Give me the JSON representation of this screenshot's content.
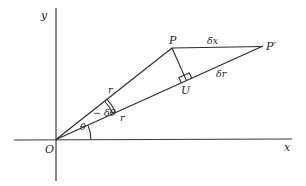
{
  "diagram": {
    "axes": {
      "x_label": "x",
      "y_label": "y",
      "origin_label": "O"
    },
    "points": {
      "P": "P",
      "P_prime": "P′",
      "U": "U"
    },
    "segment_labels": {
      "delta_x": "δx",
      "delta_r": "δr",
      "r_upper": "r",
      "r_lower": "r"
    },
    "angle_labels": {
      "theta": "θ",
      "minus_delta_theta": "− δθ"
    },
    "annotations": {
      "right_angle_at": "U"
    },
    "colors": {
      "ink": "#2a2a2a",
      "background": "#ffffff"
    }
  }
}
